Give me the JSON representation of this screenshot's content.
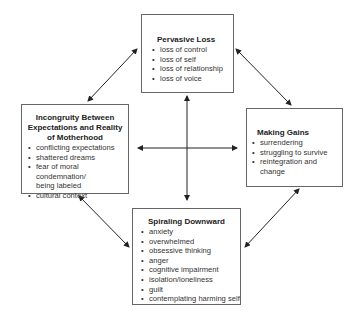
{
  "diagram": {
    "nodes": {
      "top": {
        "title": "Pervasive Loss",
        "items": [
          "loss of control",
          "loss of self",
          "loss of relationship",
          "loss of voice"
        ]
      },
      "left": {
        "title_lines": [
          "Incongruity Between",
          "Expectations and Reality",
          "of Motherhood"
        ],
        "items": [
          "conflicting expectations",
          "shattered dreams",
          "fear of moral condemnation/",
          "being labeled",
          "cultural context"
        ]
      },
      "right": {
        "title": "Making Gains",
        "items": [
          "surrendering",
          "struggling to survive",
          "reintegration and change"
        ]
      },
      "bottom": {
        "title": "Spiraling Downward",
        "items": [
          "anxiety",
          "overwhelmed",
          "obsessive thinking",
          "anger",
          "cognitive impairment",
          "isolation/loneliness",
          "guilt",
          "contemplating harming self"
        ]
      }
    },
    "edges": [
      {
        "from": "top",
        "to": "left",
        "type": "bidirectional"
      },
      {
        "from": "top",
        "to": "right",
        "type": "bidirectional"
      },
      {
        "from": "left",
        "to": "bottom",
        "type": "bidirectional"
      },
      {
        "from": "right",
        "to": "bottom",
        "type": "bidirectional"
      },
      {
        "from": "top",
        "to": "bottom",
        "type": "bidirectional"
      },
      {
        "from": "left",
        "to": "right",
        "type": "bidirectional"
      }
    ],
    "colors": {
      "line": "#222222",
      "border": "#666666"
    }
  }
}
